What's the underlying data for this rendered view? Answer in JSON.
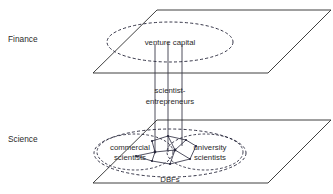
{
  "figure": {
    "background_color": "#ffffff",
    "line_color": "#2b2b2b",
    "dashed_color": "#1f1f33",
    "text_color": "#2a2a2a"
  },
  "planes": [
    {
      "id": "finance",
      "label": "Finance",
      "label_x": 8,
      "label_y": 42,
      "outline": "93,73 157,10 331,10 268,73"
    },
    {
      "id": "science",
      "label": "Science",
      "label_x": 8,
      "label_y": 142,
      "outline": "93,183 157,120 331,120 268,183"
    }
  ],
  "regions": [
    {
      "id": "venture-capital",
      "label": "venture capital",
      "label_x": 170,
      "label_y": 44,
      "shape": "ellipse",
      "cx": 170,
      "cy": 42,
      "rx": 63,
      "ry": 20,
      "style": "dashed"
    },
    {
      "id": "dbfs",
      "label": "DBFs",
      "label_x": 170,
      "label_y": 182,
      "shape": "ellipse",
      "cx": 170,
      "cy": 153,
      "rx": 76,
      "ry": 24,
      "style": "dashed"
    },
    {
      "id": "commercial-scientists",
      "label_line1": "commercial",
      "label_line2": "scientists",
      "label_x": 130,
      "label_y": 148,
      "shape": "ellipse",
      "cx": 135,
      "cy": 152,
      "rx": 38,
      "ry": 18,
      "style": "dashed"
    },
    {
      "id": "university-scientists",
      "label_line1": "university",
      "label_line2": "scientists",
      "label_x": 210,
      "label_y": 148,
      "shape": "ellipse",
      "cx": 205,
      "cy": 152,
      "rx": 38,
      "ry": 18,
      "style": "dashed"
    }
  ],
  "center_label": {
    "line1": "scientist-",
    "line2": "entrepreneurs",
    "x": 170,
    "y": 96
  },
  "connectors": {
    "description": "vertical lines linking the venture capital region to the DBFs region",
    "count": 3,
    "x_positions": [
      155,
      168,
      182
    ],
    "y_top": 44,
    "y_bottom": 152
  },
  "network": {
    "description": "small node-link web inside the overlap of the two scientist regions",
    "nodes": [
      {
        "id": "n1",
        "x": 152,
        "y": 141
      },
      {
        "id": "n2",
        "x": 168,
        "y": 136
      },
      {
        "id": "n3",
        "x": 186,
        "y": 140
      },
      {
        "id": "n4",
        "x": 196,
        "y": 146
      },
      {
        "id": "n5",
        "x": 155,
        "y": 152
      },
      {
        "id": "n6",
        "x": 175,
        "y": 150
      },
      {
        "id": "n7",
        "x": 152,
        "y": 161
      },
      {
        "id": "n8",
        "x": 170,
        "y": 164
      },
      {
        "id": "n9",
        "x": 190,
        "y": 159
      },
      {
        "id": "n10",
        "x": 136,
        "y": 156
      }
    ],
    "links": [
      [
        "n1",
        "n2"
      ],
      [
        "n2",
        "n3"
      ],
      [
        "n3",
        "n4"
      ],
      [
        "n1",
        "n5"
      ],
      [
        "n5",
        "n6"
      ],
      [
        "n6",
        "n3"
      ],
      [
        "n5",
        "n7"
      ],
      [
        "n7",
        "n8"
      ],
      [
        "n8",
        "n9"
      ],
      [
        "n9",
        "n6"
      ],
      [
        "n10",
        "n5"
      ],
      [
        "n8",
        "n6"
      ],
      [
        "n2",
        "n6"
      ],
      [
        "n7",
        "n10"
      ],
      [
        "n4",
        "n9"
      ]
    ]
  }
}
